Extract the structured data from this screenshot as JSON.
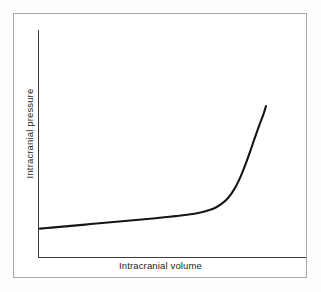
{
  "figure": {
    "background_color": "#ffffff",
    "frame_color": "#a8a8a8",
    "curve_color": "#161616",
    "axis_color": "#3a3a3a",
    "text_color": "#1d1d1d"
  },
  "chart_data": {
    "type": "line",
    "title": "",
    "subtitle": "",
    "xlabel": "Intracranial volume",
    "ylabel": "Intracranial pressure",
    "legend": [],
    "legend_position": "none",
    "grid": false,
    "x_ticks": [],
    "y_ticks": [],
    "x_tick_labels": [],
    "y_tick_labels": [],
    "xlim": [
      0,
      1
    ],
    "ylim": [
      0,
      1
    ],
    "annotations": [],
    "series": [
      {
        "name": "Intracranial compliance curve",
        "x": [
          0.0,
          0.05,
          0.1,
          0.15,
          0.2,
          0.25,
          0.3,
          0.35,
          0.4,
          0.45,
          0.5,
          0.55,
          0.6,
          0.65,
          0.7,
          0.75,
          0.78,
          0.81,
          0.83,
          0.85,
          0.87,
          0.89,
          0.91,
          0.93,
          0.95,
          0.97,
          0.99,
          1.0
        ],
        "y": [
          0.105,
          0.112,
          0.119,
          0.126,
          0.133,
          0.14,
          0.147,
          0.154,
          0.161,
          0.168,
          0.175,
          0.183,
          0.191,
          0.2,
          0.212,
          0.233,
          0.252,
          0.283,
          0.312,
          0.352,
          0.404,
          0.47,
          0.548,
          0.635,
          0.725,
          0.812,
          0.895,
          0.945
        ]
      }
    ]
  }
}
